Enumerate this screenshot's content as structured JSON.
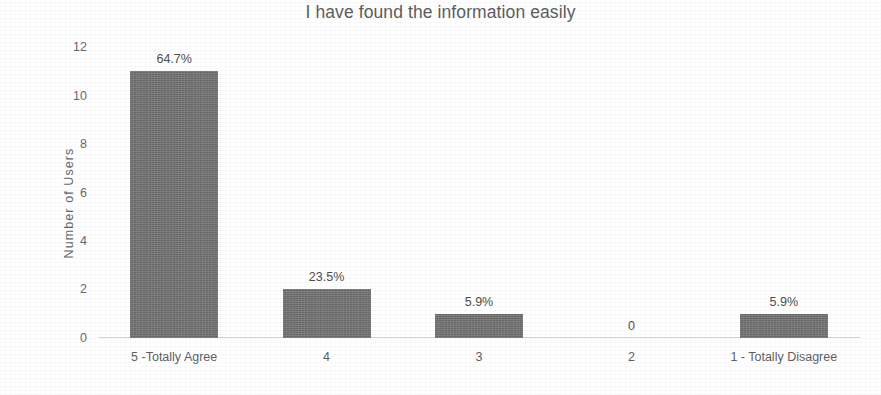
{
  "chart_data": {
    "type": "bar",
    "title": "I have found the information easily",
    "xlabel": "",
    "ylabel": "Number of Users",
    "categories": [
      "5 -Totally Agree",
      "4",
      "3",
      "2",
      "1 - Totally Disagree"
    ],
    "values": [
      11,
      2,
      1,
      0,
      1
    ],
    "data_labels": [
      "64.7%",
      "23.5%",
      "5.9%",
      "0",
      "5.9%"
    ],
    "ylim": [
      0,
      12
    ],
    "yticks": [
      0,
      2,
      4,
      6,
      8,
      10,
      12
    ],
    "ytick_labels": [
      "0",
      "2",
      "4",
      "6",
      "8",
      "10",
      "12"
    ],
    "grid": false,
    "legend": false,
    "legend_position": "none",
    "bar_color": "#727272",
    "title_color": "#5d5d5d",
    "axis_label_color": "#6a6a6a",
    "baseline_color": "#d4d4d4",
    "background_color": "#ffffff"
  }
}
